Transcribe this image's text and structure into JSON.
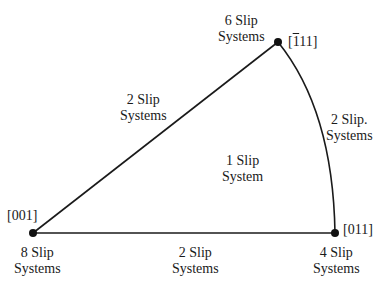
{
  "diagram": {
    "type": "stereographic-triangle",
    "colors": {
      "line": "#1a1a1a",
      "vertex": "#111111",
      "background": "#ffffff"
    },
    "vertices": [
      {
        "id": "v001",
        "label": "[001]",
        "slip_top": "8 Slip",
        "slip_bottom": "Systems"
      },
      {
        "id": "v011",
        "label": "[011]",
        "slip_top": "4 Slip",
        "slip_bottom": "Systems"
      },
      {
        "id": "v111",
        "label_bar": "1",
        "label_rest": "11]",
        "label_open": "[",
        "slip_top": "6 Slip",
        "slip_bottom": "Systems"
      }
    ],
    "edges": [
      {
        "id": "edge-001-111",
        "slip_top": "2 Slip",
        "slip_bottom": "Systems"
      },
      {
        "id": "edge-001-011",
        "slip_top": "2 Slip",
        "slip_bottom": "Systems"
      },
      {
        "id": "edge-011-111",
        "slip_top": "2 Slip.",
        "slip_bottom": "Systems"
      }
    ],
    "interior": {
      "slip_top": "1 Slip",
      "slip_bottom": "System"
    }
  }
}
